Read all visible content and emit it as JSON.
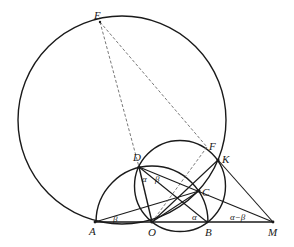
{
  "figure": {
    "type": "geometry-diagram",
    "points": {
      "E": {
        "label": "E",
        "x": 100,
        "y": 22
      },
      "A": {
        "label": "A",
        "x": 95,
        "y": 222
      },
      "O": {
        "label": "O",
        "x": 152,
        "y": 222
      },
      "B": {
        "label": "B",
        "x": 207,
        "y": 222
      },
      "M": {
        "label": "M",
        "x": 273,
        "y": 222
      },
      "D": {
        "label": "D",
        "x": 139,
        "y": 167
      },
      "C": {
        "label": "C",
        "x": 199,
        "y": 191
      },
      "K": {
        "label": "K",
        "x": 218,
        "y": 160
      },
      "F": {
        "label": "F",
        "x": 207,
        "y": 147
      }
    },
    "angle_labels": {
      "at_D_1": "α",
      "at_D_2": "β",
      "at_A": "β",
      "at_B": "α",
      "at_M": "α−β"
    },
    "circles": [
      {
        "name": "circle-E-A-K",
        "cx": 122,
        "cy": 120,
        "r": 104
      },
      {
        "name": "semicircle-A-B-center-O",
        "cx": 152,
        "cy": 222,
        "r": 56
      },
      {
        "name": "circle-D-O-K",
        "cx": 180,
        "cy": 186,
        "r": 45.5
      }
    ],
    "solid_segments": [
      [
        "A",
        "M"
      ],
      [
        "D",
        "O"
      ],
      [
        "D",
        "B"
      ],
      [
        "D",
        "M"
      ],
      [
        "A",
        "C"
      ],
      [
        "O",
        "K"
      ],
      [
        "O",
        "C"
      ],
      [
        "K",
        "M"
      ]
    ],
    "dashed_segments": [
      [
        "E",
        "D"
      ],
      [
        "E",
        "F"
      ],
      [
        "O",
        "F"
      ]
    ]
  }
}
